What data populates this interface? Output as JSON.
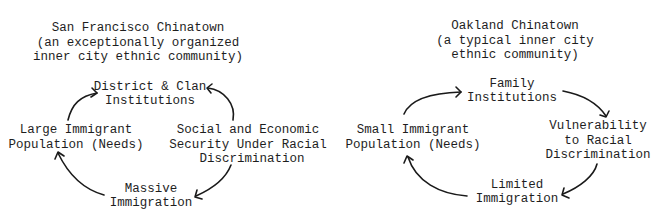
{
  "diagrams": [
    {
      "id": "san-francisco",
      "title_lines": [
        "San Francisco Chinatown",
        "(an exceptionally organized",
        "inner city ethnic community)"
      ],
      "nodes": {
        "top": [
          "District & Clan",
          "Institutions"
        ],
        "left": [
          "Large Immigrant",
          "Population (Needs)"
        ],
        "right": [
          "Social and Economic",
          "Security Under Racial",
          "Discrimination"
        ],
        "bottom": [
          "Massive",
          "Immigration"
        ]
      },
      "cycle": [
        "left",
        "top",
        "right",
        "bottom",
        "left"
      ],
      "arrow_directions": {
        "left_to_top": "points to top",
        "right_to_top": "points to top",
        "right_to_bottom": "points to bottom",
        "bottom_to_left": "points to left"
      }
    },
    {
      "id": "oakland",
      "title_lines": [
        "Oakland Chinatown",
        "(a typical inner city",
        "ethnic community)"
      ],
      "nodes": {
        "top": [
          "Family",
          "Institutions"
        ],
        "left": [
          "Small Immigrant",
          "Population (Needs)"
        ],
        "right": [
          "Vulnerability",
          "to Racial",
          "Discrimination"
        ],
        "bottom": [
          "Limited",
          "Immigration"
        ]
      },
      "cycle": [
        "left",
        "top",
        "right",
        "bottom",
        "left"
      ],
      "arrow_directions": {
        "left_to_top": "points to top",
        "top_to_right": "points to right",
        "right_to_bottom": "points to bottom",
        "bottom_to_left": "points to left"
      }
    }
  ]
}
